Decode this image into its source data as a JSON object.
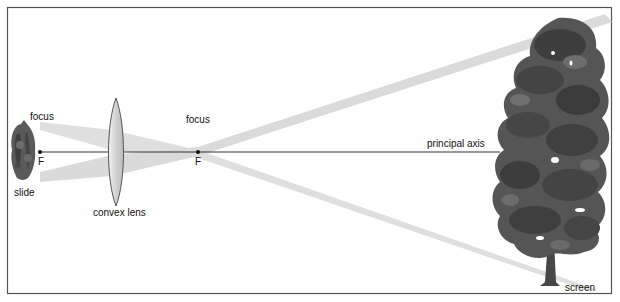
{
  "diagram": {
    "labels": {
      "focus_left": "focus",
      "focus_right": "focus",
      "f_left": "F",
      "f_right": "F",
      "slide": "slide",
      "lens": "convex lens",
      "axis": "principal axis",
      "screen": "screen"
    },
    "colors": {
      "frame": "#555555",
      "axis": "#333333",
      "beam": "#d9d9d9",
      "lens_fill": "#e6e6e6",
      "lens_stroke": "#555555",
      "foliage_dark": "#3f3f3f",
      "foliage_mid": "#5c5c5c",
      "foliage_light": "#777777",
      "trunk": "#444444"
    }
  }
}
